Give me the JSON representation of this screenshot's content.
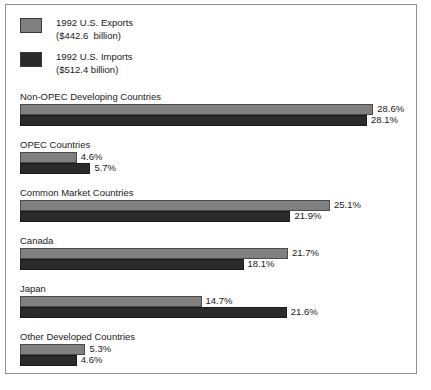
{
  "chart_data": {
    "type": "bar",
    "orientation": "horizontal",
    "title": "",
    "xlabel": "",
    "ylabel": "",
    "grid": false,
    "legend_position": "top-left",
    "xlim": [
      0,
      30
    ],
    "categories": [
      "Non-OPEC Developing Countries",
      "OPEC Countries",
      "Common Market Countries",
      "Canada",
      "Japan",
      "Other Developed Countries"
    ],
    "series": [
      {
        "name": "1992 U.S. Exports",
        "subtitle": "($442.6  billion)",
        "color": "#808080",
        "values": [
          28.6,
          4.6,
          25.1,
          21.7,
          14.7,
          5.3
        ],
        "labels": [
          "28.6%",
          "4.6%",
          "25.1%",
          "21.7%",
          "14.7%",
          "5.3%"
        ]
      },
      {
        "name": "1992 U.S. Imports",
        "subtitle": "($512.4 billion)",
        "color": "#2b2b2b",
        "values": [
          28.1,
          5.7,
          21.9,
          18.1,
          21.6,
          4.6
        ],
        "labels": [
          "28.1%",
          "5.7%",
          "21.9%",
          "18.1%",
          "21.6%",
          "4.6%"
        ]
      }
    ]
  },
  "legend": {
    "items": [
      {
        "label": "1992 U.S. Exports",
        "amount": "($442.6  billion)",
        "swatch": "light"
      },
      {
        "label": "1992 U.S. Imports",
        "amount": "($512.4 billion)",
        "swatch": "dark"
      }
    ]
  },
  "colors": {
    "exports": "#808080",
    "imports": "#2b2b2b",
    "border": "#8f8f8f",
    "text": "#1a1a1a",
    "background": "#ffffff"
  },
  "scale": {
    "origin_x": 14,
    "px_per_percent": 12.35
  }
}
